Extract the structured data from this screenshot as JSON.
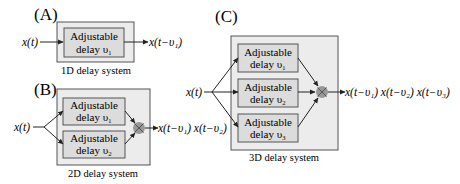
{
  "panels": {
    "A": {
      "label": "(A)",
      "caption": "1D delay system",
      "input": "x(t)",
      "output": "x(t−υ₁)",
      "blocks": [
        {
          "line1": "Adjustable",
          "line2": "delay υ₁"
        }
      ]
    },
    "B": {
      "label": "(B)",
      "caption": "2D delay system",
      "input": "x(t)",
      "output": "x(t−υ₁) x(t−υ₂)",
      "blocks": [
        {
          "line1": "Adjustable",
          "line2": "delay υ₁"
        },
        {
          "line1": "Adjustable",
          "line2": "delay υ₂"
        }
      ]
    },
    "C": {
      "label": "(C)",
      "caption": "3D delay system",
      "input": "x(t)",
      "output": "x(t−υ₁) x(t−υ₂) x(t−υ₃)",
      "blocks": [
        {
          "line1": "Adjustable",
          "line2": "delay υ₁"
        },
        {
          "line1": "Adjustable",
          "line2": "delay υ₂"
        },
        {
          "line1": "Adjustable",
          "line2": "delay υ₃"
        }
      ]
    }
  },
  "colors": {
    "outer_fill": "#ececec",
    "inner_fill": "#dcdcdc",
    "stroke": "#555555",
    "multiplier": "#8a8a8a",
    "line": "#222222"
  }
}
